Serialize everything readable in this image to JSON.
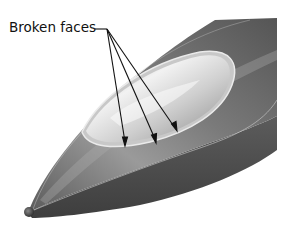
{
  "figure": {
    "callout": {
      "label": "Broken faces",
      "arrow_count": 3
    },
    "colors": {
      "background": "#ffffff",
      "hull_dark": "#4a4a4a",
      "hull_mid": "#6e6e6e",
      "hull_light": "#a8a8a8",
      "canopy_light": "#e8e8e8",
      "leader_line": "#111111"
    }
  }
}
